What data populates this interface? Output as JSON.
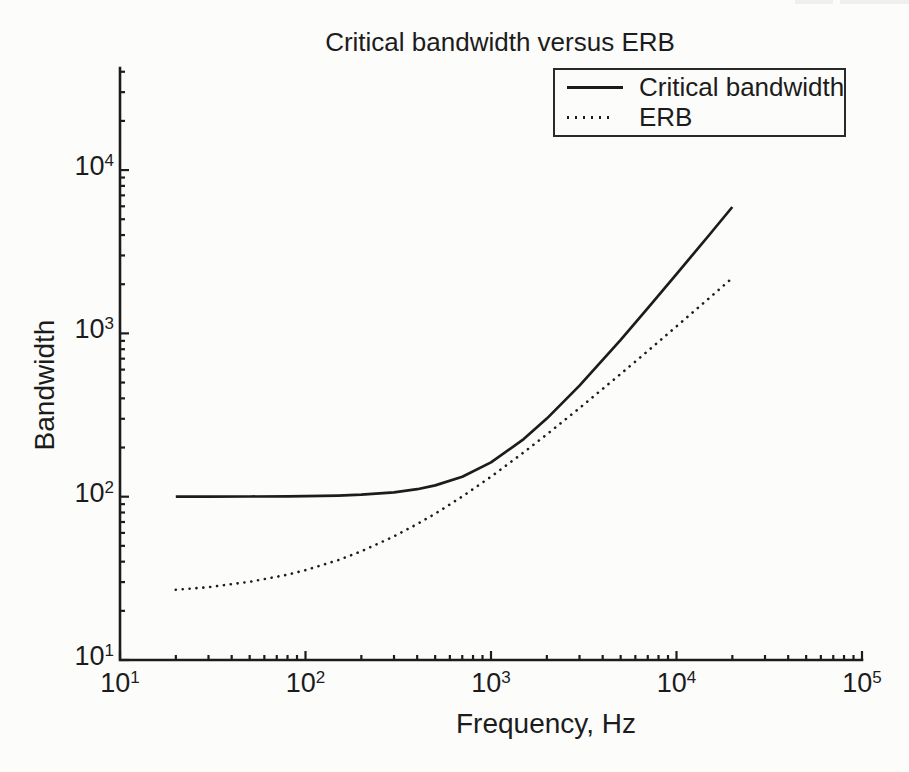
{
  "figure": {
    "title": "Critical bandwidth versus ERB",
    "xlabel": "Frequency, Hz",
    "ylabel": "Bandwidth"
  },
  "legend": {
    "items": [
      {
        "label": "Critical bandwidth",
        "style": "solid"
      },
      {
        "label": "ERB",
        "style": "dotted"
      }
    ]
  },
  "chart_data": {
    "type": "line",
    "title": "Critical bandwidth versus ERB",
    "xlabel": "Frequency, Hz",
    "ylabel": "Bandwidth",
    "x_scale": "log",
    "y_scale": "log",
    "xlim": [
      10,
      100000
    ],
    "ylim": [
      10,
      40000
    ],
    "grid": false,
    "legend_position": "top-right",
    "x_ticks": [
      {
        "base": "10",
        "exp": "1"
      },
      {
        "base": "10",
        "exp": "2"
      },
      {
        "base": "10",
        "exp": "3"
      },
      {
        "base": "10",
        "exp": "4"
      },
      {
        "base": "10",
        "exp": "5"
      }
    ],
    "y_ticks": [
      {
        "base": "10",
        "exp": "1"
      },
      {
        "base": "10",
        "exp": "2"
      },
      {
        "base": "10",
        "exp": "3"
      },
      {
        "base": "10",
        "exp": "4"
      }
    ],
    "x": [
      20,
      30,
      50,
      80,
      100,
      150,
      200,
      300,
      400,
      500,
      700,
      1000,
      1500,
      2000,
      3000,
      5000,
      7000,
      10000,
      15000,
      20000
    ],
    "series": [
      {
        "name": "Critical bandwidth",
        "line": "solid",
        "y": [
          100.0,
          100.1,
          100.2,
          100.5,
          100.7,
          101.6,
          102.9,
          106.4,
          111.2,
          117.3,
          132.6,
          162.2,
          225.2,
          300.8,
          479.2,
          914,
          1426,
          2306,
          4004,
          5939
        ]
      },
      {
        "name": "ERB",
        "line": "dotted",
        "y": [
          26.9,
          27.9,
          30.1,
          33.3,
          35.5,
          40.9,
          46.3,
          57.1,
          67.9,
          78.7,
          100.3,
          132.6,
          186.6,
          240.6,
          348.5,
          564.4,
          780.3,
          1104,
          1644,
          2184
        ]
      }
    ],
    "colors": {
      "ink": "#1c1c1c",
      "paper": "#fcfcfb"
    }
  }
}
